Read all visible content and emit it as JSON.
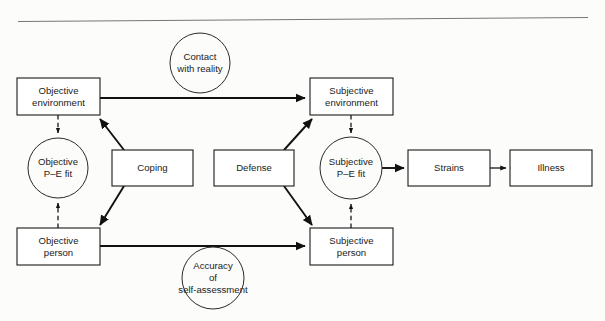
{
  "figure": {
    "background_color": "#fcfcfa",
    "line_color": "#111111",
    "box_fill": "#ffffff",
    "rule_color": "#777777",
    "width": 605,
    "height": 321
  },
  "nodes": {
    "objective_environment": {
      "label_line1": "Objective",
      "label_line2": "environment",
      "shape": "rect",
      "x": 17,
      "y": 78,
      "w": 83,
      "h": 37
    },
    "subjective_environment": {
      "label_line1": "Subjective",
      "label_line2": "environment",
      "shape": "rect",
      "x": 310,
      "y": 78,
      "w": 83,
      "h": 37
    },
    "objective_person": {
      "label_line1": "Objective",
      "label_line2": "person",
      "shape": "rect",
      "x": 17,
      "y": 228,
      "w": 83,
      "h": 37
    },
    "subjective_person": {
      "label_line1": "Subjective",
      "label_line2": "person",
      "shape": "rect",
      "x": 310,
      "y": 228,
      "w": 83,
      "h": 37
    },
    "coping": {
      "label_line1": "Coping",
      "label_line2": "",
      "shape": "rect",
      "x": 112,
      "y": 150,
      "w": 81,
      "h": 36
    },
    "defense": {
      "label_line1": "Defense",
      "label_line2": "",
      "shape": "rect",
      "x": 214,
      "y": 150,
      "w": 80,
      "h": 36
    },
    "strains": {
      "label_line1": "Strains",
      "label_line2": "",
      "shape": "rect",
      "x": 408,
      "y": 150,
      "w": 82,
      "h": 36
    },
    "illness": {
      "label_line1": "Illness",
      "label_line2": "",
      "shape": "rect",
      "x": 510,
      "y": 150,
      "w": 82,
      "h": 36
    },
    "objective_pe_fit": {
      "label_line1": "Objective",
      "label_line2": "P–E fit",
      "shape": "circle",
      "cx": 58,
      "cy": 168,
      "r": 30
    },
    "subjective_pe_fit": {
      "label_line1": "Subjective",
      "label_line2": "P–E fit",
      "shape": "circle",
      "cx": 351,
      "cy": 168,
      "r": 31
    },
    "contact_with_reality": {
      "label_line1": "Contact",
      "label_line2": "with reality",
      "shape": "circle",
      "cx": 200,
      "cy": 63,
      "r": 30
    },
    "accuracy_of_self_assessment": {
      "label_line1": "Accuracy",
      "label_line2": "of",
      "label_line3": "self-assessment",
      "shape": "circle",
      "cx": 213,
      "cy": 278,
      "r": 31
    }
  },
  "edges": [
    {
      "name": "objective-environment-to-subjective-environment",
      "style": "solid",
      "arrow": "end"
    },
    {
      "name": "objective-person-to-subjective-person",
      "style": "solid",
      "arrow": "end"
    },
    {
      "name": "objective-environment-to-objective-pe-fit",
      "style": "dashed",
      "arrow": "end"
    },
    {
      "name": "objective-person-to-objective-pe-fit",
      "style": "dashed",
      "arrow": "end"
    },
    {
      "name": "subjective-environment-to-subjective-pe-fit",
      "style": "dashed",
      "arrow": "end"
    },
    {
      "name": "subjective-person-to-subjective-pe-fit",
      "style": "dashed",
      "arrow": "end"
    },
    {
      "name": "coping-to-objective-environment",
      "style": "solid",
      "arrow": "end"
    },
    {
      "name": "coping-to-objective-person",
      "style": "solid",
      "arrow": "end"
    },
    {
      "name": "defense-to-subjective-environment",
      "style": "solid",
      "arrow": "end"
    },
    {
      "name": "defense-to-subjective-person",
      "style": "solid",
      "arrow": "end"
    },
    {
      "name": "subjective-pe-fit-to-strains",
      "style": "solid",
      "arrow": "end"
    },
    {
      "name": "strains-to-illness",
      "style": "thin-solid",
      "arrow": "end"
    }
  ]
}
